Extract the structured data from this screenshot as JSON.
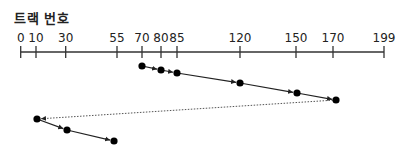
{
  "title": "트랙 번호",
  "axis": {
    "ticks": [
      0,
      10,
      30,
      55,
      70,
      80,
      85,
      120,
      150,
      170,
      199
    ],
    "tick_px": [
      20.7,
      36,
      65.7,
      117,
      142,
      161,
      177,
      240,
      296,
      333,
      384
    ],
    "y": 52,
    "color": "#333333"
  },
  "path": {
    "sequence": [
      70,
      80,
      85,
      120,
      150,
      170,
      10,
      30,
      55
    ],
    "points": [
      {
        "track": 70,
        "x": 142,
        "y": 66
      },
      {
        "track": 80,
        "x": 161,
        "y": 70
      },
      {
        "track": 85,
        "x": 177,
        "y": 73
      },
      {
        "track": 120,
        "x": 240,
        "y": 83
      },
      {
        "track": 150,
        "x": 297,
        "y": 93
      },
      {
        "track": 170,
        "x": 336,
        "y": 100
      },
      {
        "track": 10,
        "x": 37,
        "y": 119
      },
      {
        "track": 30,
        "x": 67,
        "y": 130
      },
      {
        "track": 55,
        "x": 114,
        "y": 141
      }
    ],
    "dashed_segment": [
      5,
      6
    ],
    "point_color": "#000000",
    "line_color": "#222222",
    "dashed_color": "#555555"
  }
}
